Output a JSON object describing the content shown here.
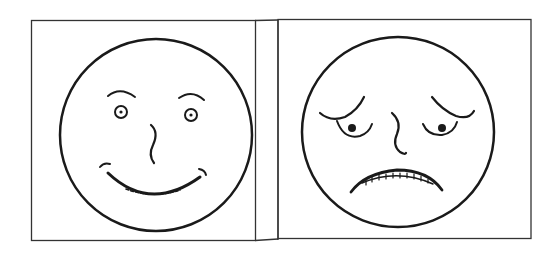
{
  "figure": {
    "panels": [
      {
        "id": "happy",
        "expression": "smiling face",
        "icon": "happy-face-icon"
      },
      {
        "id": "sad",
        "expression": "sad worried face",
        "icon": "sad-face-icon"
      }
    ],
    "colors": {
      "line": "#1a1a1a",
      "background": "#ffffff",
      "border": "#333333"
    }
  }
}
